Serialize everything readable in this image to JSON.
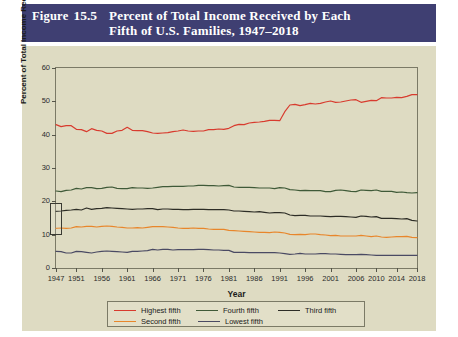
{
  "header": {
    "figure_word": "Figure",
    "figure_number": "15.5",
    "title_line1": "Percent of Total Income Received by Each",
    "title_line2": "Fifth of U.S. Families, 1947–2018",
    "band_color": "#3f3f72"
  },
  "panel": {
    "background_color": "#dedbc2",
    "frame_color": "#7b7a66"
  },
  "chart_data": {
    "type": "line",
    "xlabel": "Year",
    "ylabel": "Percent of Total Income Received",
    "xlim": [
      1947,
      2018
    ],
    "ylim": [
      0,
      60
    ],
    "yticks": [
      0,
      10,
      20,
      30,
      40,
      50,
      60
    ],
    "xticks": [
      1947,
      1951,
      1956,
      1961,
      1966,
      1971,
      1976,
      1981,
      1986,
      1991,
      1996,
      2001,
      2006,
      2010,
      2014,
      2018
    ],
    "grid": false,
    "legend_position": "bottom",
    "x": [
      1947,
      1948,
      1949,
      1950,
      1951,
      1952,
      1953,
      1954,
      1955,
      1956,
      1957,
      1958,
      1959,
      1960,
      1961,
      1962,
      1963,
      1964,
      1965,
      1966,
      1967,
      1968,
      1969,
      1970,
      1971,
      1972,
      1973,
      1974,
      1975,
      1976,
      1977,
      1978,
      1979,
      1980,
      1981,
      1982,
      1983,
      1984,
      1985,
      1986,
      1987,
      1988,
      1989,
      1990,
      1991,
      1992,
      1993,
      1994,
      1995,
      1996,
      1997,
      1998,
      1999,
      2000,
      2001,
      2002,
      2003,
      2004,
      2005,
      2006,
      2007,
      2008,
      2009,
      2010,
      2011,
      2012,
      2013,
      2014,
      2015,
      2016,
      2017,
      2018
    ],
    "series": [
      {
        "name": "Highest fifth",
        "color": "#d83b2e",
        "values": [
          43.0,
          42.4,
          42.7,
          42.7,
          41.6,
          41.5,
          40.9,
          41.8,
          41.3,
          41.1,
          40.4,
          40.4,
          41.1,
          41.3,
          42.2,
          41.3,
          41.2,
          41.2,
          40.9,
          40.5,
          40.4,
          40.5,
          40.6,
          40.9,
          41.1,
          41.4,
          41.1,
          41.0,
          41.1,
          41.1,
          41.5,
          41.5,
          41.7,
          41.6,
          41.9,
          42.7,
          43.1,
          43.0,
          43.5,
          43.7,
          43.8,
          44.0,
          44.3,
          44.3,
          44.2,
          46.9,
          48.9,
          49.1,
          48.7,
          49.0,
          49.4,
          49.2,
          49.4,
          49.8,
          50.1,
          49.7,
          49.8,
          50.1,
          50.4,
          50.5,
          49.7,
          50.0,
          50.3,
          50.2,
          51.1,
          51.0,
          51.0,
          51.2,
          51.1,
          51.5,
          52.0,
          52.0
        ]
      },
      {
        "name": "Fourth fifth",
        "color": "#3f5a38",
        "values": [
          23.1,
          22.9,
          23.3,
          23.4,
          23.9,
          23.7,
          24.1,
          24.1,
          23.8,
          23.9,
          24.2,
          24.3,
          23.9,
          23.8,
          23.8,
          24.1,
          24.0,
          24.0,
          23.9,
          24.0,
          24.2,
          24.4,
          24.4,
          24.5,
          24.5,
          24.5,
          24.6,
          24.6,
          24.8,
          24.8,
          24.7,
          24.7,
          24.6,
          24.7,
          24.8,
          24.3,
          24.2,
          24.2,
          24.2,
          24.1,
          24.0,
          24.0,
          24.0,
          23.8,
          24.1,
          24.0,
          23.5,
          23.4,
          23.2,
          23.3,
          23.2,
          23.2,
          23.2,
          22.9,
          22.9,
          23.3,
          23.4,
          23.2,
          23.0,
          22.9,
          23.4,
          23.3,
          23.2,
          23.4,
          23.0,
          23.0,
          23.0,
          22.7,
          22.8,
          22.6,
          22.5,
          22.6
        ]
      },
      {
        "name": "Third fifth",
        "color": "#2d2d26",
        "values": [
          17.0,
          17.1,
          17.3,
          17.4,
          17.6,
          17.4,
          18.0,
          17.6,
          17.8,
          17.9,
          18.1,
          18.0,
          17.9,
          17.8,
          17.7,
          17.6,
          17.7,
          17.7,
          17.8,
          17.8,
          17.5,
          17.7,
          17.7,
          17.6,
          17.6,
          17.5,
          17.5,
          17.6,
          17.6,
          17.6,
          17.5,
          17.5,
          17.5,
          17.5,
          17.4,
          17.1,
          17.1,
          17.0,
          16.9,
          16.8,
          16.9,
          16.7,
          16.5,
          16.6,
          16.6,
          16.5,
          15.9,
          15.7,
          15.8,
          15.8,
          15.6,
          15.6,
          15.6,
          15.5,
          15.4,
          15.5,
          15.5,
          15.4,
          15.3,
          15.2,
          15.6,
          15.5,
          15.3,
          15.4,
          14.9,
          14.9,
          14.9,
          14.8,
          14.7,
          14.8,
          14.3,
          14.1
        ]
      },
      {
        "name": "Second fifth",
        "color": "#e8862b",
        "values": [
          11.9,
          12.0,
          11.9,
          12.0,
          12.4,
          12.3,
          12.5,
          12.5,
          12.3,
          12.5,
          12.6,
          12.5,
          12.3,
          12.2,
          12.0,
          12.0,
          12.1,
          12.0,
          12.2,
          12.4,
          12.4,
          12.4,
          12.3,
          12.2,
          12.0,
          11.9,
          11.9,
          12.0,
          11.9,
          11.9,
          11.7,
          11.6,
          11.6,
          11.6,
          11.3,
          11.2,
          11.1,
          11.0,
          10.9,
          10.8,
          10.7,
          10.7,
          10.6,
          10.8,
          10.7,
          10.5,
          10.1,
          10.0,
          10.1,
          10.0,
          10.2,
          10.2,
          10.0,
          9.9,
          9.7,
          9.8,
          9.6,
          9.6,
          9.6,
          9.6,
          9.8,
          9.6,
          9.4,
          9.6,
          9.3,
          9.2,
          9.3,
          9.4,
          9.4,
          9.5,
          9.2,
          9.1
        ]
      },
      {
        "name": "Lowest fifth",
        "color": "#4a4a63",
        "values": [
          5.0,
          4.9,
          4.5,
          4.5,
          5.0,
          4.9,
          4.7,
          4.5,
          4.8,
          5.0,
          5.1,
          5.0,
          4.9,
          4.8,
          4.7,
          5.0,
          5.0,
          5.1,
          5.2,
          5.6,
          5.4,
          5.6,
          5.6,
          5.4,
          5.5,
          5.5,
          5.5,
          5.5,
          5.6,
          5.6,
          5.5,
          5.4,
          5.4,
          5.3,
          5.3,
          4.7,
          4.7,
          4.7,
          4.6,
          4.6,
          4.6,
          4.6,
          4.6,
          4.6,
          4.5,
          4.3,
          4.1,
          4.2,
          4.4,
          4.2,
          4.2,
          4.2,
          4.3,
          4.3,
          4.2,
          4.2,
          4.1,
          4.0,
          4.0,
          4.0,
          4.1,
          4.0,
          3.9,
          3.8,
          3.8,
          3.8,
          3.8,
          3.8,
          3.8,
          3.8,
          3.8,
          3.8
        ]
      }
    ],
    "annotation": {
      "name": "bracket-box",
      "x": 1947,
      "y_low": 10,
      "y_high": 19.5
    }
  },
  "legend": {
    "rows": [
      [
        {
          "label": "Highest fifth",
          "color": "#d83b2e"
        },
        {
          "label": "Fourth fifth",
          "color": "#3f5a38"
        },
        {
          "label": "Third fifth",
          "color": "#2d2d26"
        }
      ],
      [
        {
          "label": "Second fifth",
          "color": "#e8862b"
        },
        {
          "label": "Lowest fifth",
          "color": "#4a4a63"
        }
      ]
    ]
  }
}
